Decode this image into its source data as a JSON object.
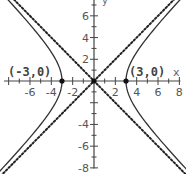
{
  "chart_data": {
    "type": "line",
    "title": "",
    "xlabel": "x",
    "ylabel": "y",
    "xlim": [
      -8.8,
      8.6
    ],
    "ylim": [
      -8.5,
      7.5
    ],
    "grid": false,
    "x_ticks": [
      -6,
      -4,
      -2,
      2,
      4,
      6,
      8
    ],
    "y_ticks": [
      6,
      4,
      2,
      -4,
      -6,
      -8
    ],
    "x_tick_labels": [
      "-6",
      "-4",
      "-2",
      "2",
      "4",
      "6",
      "8"
    ],
    "y_tick_labels": [
      "6",
      "4",
      "2",
      "-4",
      "-6",
      "-8"
    ],
    "series": [
      {
        "name": "hyperbola",
        "equation": "x^2/9 - y^2/9 = 1",
        "style": "solid",
        "color": "#333333"
      },
      {
        "name": "asymptote y = x",
        "equation": "y = x",
        "style": "dotted",
        "color": "#222222"
      },
      {
        "name": "asymptote y = -x",
        "equation": "y = -x",
        "style": "dotted",
        "color": "#222222"
      }
    ],
    "points": [
      {
        "x": -3,
        "y": 0,
        "label": "(-3,0)"
      },
      {
        "x": 0,
        "y": 0,
        "label": ""
      },
      {
        "x": 3,
        "y": 0,
        "label": "(3,0)"
      }
    ]
  },
  "labels": {
    "left_vertex": "(-3,0)",
    "right_vertex": "(3,0)",
    "x_axis": "x",
    "y_axis": "y"
  },
  "colors": {
    "background": "#ffffff",
    "axis": "#444444",
    "curve": "#333333",
    "asymptote": "#222222",
    "text": "#555555"
  }
}
